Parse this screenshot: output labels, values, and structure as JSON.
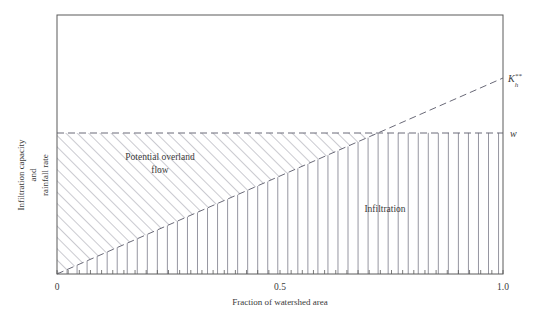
{
  "chart_data": {
    "type": "line",
    "title": "",
    "xlabel": "Fraction of watershed area",
    "ylabel_line1": "Infiltration capacity",
    "ylabel_line2": "and",
    "ylabel_line3": "rainfall rate",
    "xlim": [
      0,
      1.0
    ],
    "ylim": [
      0,
      1.0
    ],
    "x_ticklabels": [
      "0",
      "0.5",
      "1.0"
    ],
    "x_tickvalues": [
      0,
      0.5,
      1.0
    ],
    "y_ticklabels": [],
    "grid": false,
    "legend": "none",
    "minor_tick_count": 40,
    "series": [
      {
        "name": "w",
        "label": "w",
        "style": "dashed-horizontal",
        "description": "Constant rainfall rate line",
        "y_value": 0.545,
        "x": [
          0,
          1.0
        ],
        "values": [
          0.545,
          0.545
        ]
      },
      {
        "name": "Kh",
        "label_base": "K",
        "label_sub": "h",
        "label_sup": "**",
        "style": "dashed-diagonal",
        "description": "Saturated hydraulic conductivity increasing linearly with fraction of watershed area",
        "x": [
          0,
          1.0
        ],
        "values": [
          0,
          0.755
        ]
      }
    ],
    "crossing_point": {
      "x": 0.722,
      "y": 0.545
    },
    "regions": [
      {
        "name": "potential-overland-flow",
        "label_line1": "Potential overland",
        "label_line2": "flow",
        "hatch": "diagonal",
        "description": "Area between the Kh** line and the w line where rainfall exceeds infiltration capacity"
      },
      {
        "name": "infiltration",
        "label_line1": "Infiltration",
        "hatch": "vertical",
        "description": "Area below the Kh** line and below the w line that infiltrates"
      }
    ]
  },
  "colors": {
    "axis": "#5a5a5a",
    "hatch": "#8a8a96",
    "dash": "#6a6a78",
    "text": "#3a3a3a",
    "background": "#ffffff"
  }
}
